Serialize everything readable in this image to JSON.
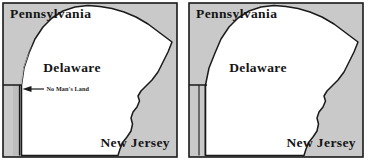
{
  "figure": {
    "panel_count": 2
  },
  "colors": {
    "land_neighbor": "#c9c9c9",
    "land_delaware": "#ffffff",
    "outline": "#1a1a1a",
    "background": "#ffffff",
    "no_mans_land_fill": "#bdbdbd"
  },
  "panels": [
    {
      "id": "left",
      "name": "panel-with-no-mans-land",
      "labels": {
        "pennsylvania": "Pennsylvania",
        "delaware": "Delaware",
        "new_jersey": "New Jersey",
        "no_mans_land": "No Man's Land"
      },
      "has_callout": true,
      "callout_arrow": "left-arrow"
    },
    {
      "id": "right",
      "name": "panel-without-no-mans-land",
      "labels": {
        "pennsylvania": "Pennsylvania",
        "delaware": "Delaware",
        "new_jersey": "New Jersey"
      },
      "has_callout": false
    }
  ]
}
